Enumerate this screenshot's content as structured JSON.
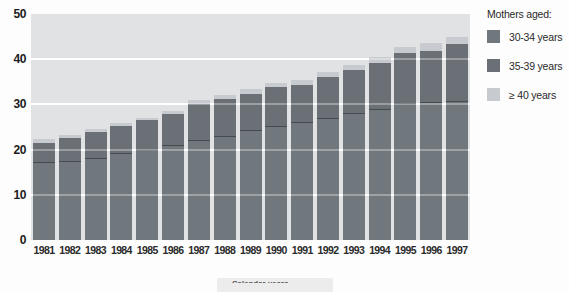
{
  "chart_data": {
    "type": "bar",
    "stacked": true,
    "title": "",
    "xlabel": "",
    "ylabel": "",
    "categories": [
      "1981",
      "1982",
      "1983",
      "1984",
      "1985",
      "1986",
      "1987",
      "1988",
      "1989",
      "1990",
      "1991",
      "1992",
      "1993",
      "1994",
      "1995",
      "1996",
      "1997"
    ],
    "series": [
      {
        "name": "30-34 years",
        "color": "#70777d",
        "values": [
          17.0,
          17.3,
          17.9,
          19.0,
          19.8,
          20.9,
          22.0,
          22.8,
          24.1,
          25.0,
          25.9,
          26.7,
          27.8,
          28.7,
          30.2,
          30.4,
          30.5
        ]
      },
      {
        "name": "35-39 years",
        "color": "#6a7076",
        "values": [
          4.5,
          5.3,
          6.0,
          6.2,
          6.7,
          6.9,
          8.0,
          8.4,
          8.3,
          8.8,
          8.4,
          9.3,
          9.9,
          10.5,
          11.1,
          11.5,
          12.8
        ]
      },
      {
        "name": "≥ 40 years",
        "color": "#c7cbcf",
        "values": [
          0.8,
          0.7,
          0.7,
          0.7,
          0.6,
          0.7,
          0.9,
          0.9,
          1.0,
          0.9,
          1.1,
          1.1,
          1.1,
          1.3,
          1.5,
          1.8,
          1.7
        ]
      }
    ],
    "totals": [
      22.3,
      23.3,
      24.6,
      25.9,
      27.1,
      28.5,
      30.9,
      32.1,
      33.4,
      34.7,
      35.4,
      37.1,
      38.8,
      40.5,
      42.8,
      43.7,
      45.0
    ],
    "ylim": [
      0,
      50
    ],
    "yticks": [
      0,
      10,
      20,
      30,
      40,
      50
    ],
    "grid": "horizontal white lines every 10 units",
    "legend_position": "right",
    "plot_bg": "#e0e2e3",
    "gridline_color": "#ffffff"
  },
  "legend": {
    "title": "Mothers aged:"
  },
  "footer": {
    "clipped_label": "Calendar years"
  }
}
